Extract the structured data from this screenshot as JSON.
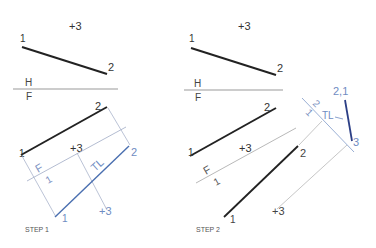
{
  "colors": {
    "ink": "#222222",
    "construction": "#b8b8b8",
    "blue": "#4a6fb0",
    "blue_dark": "#2c3f86",
    "blue_light": "#8ea6cf",
    "gray_text": "#555555"
  },
  "step1": {
    "caption": "STEP 1",
    "top_view": {
      "point3": "+3",
      "p1": "1",
      "p2": "2"
    },
    "fold_line": {
      "upper": "H",
      "lower": "F"
    },
    "front_view": {
      "p1": "1",
      "p2": "2",
      "point3": "+3"
    },
    "aux_fold": {
      "upper": "F",
      "lower": "1"
    },
    "aux_view": {
      "p1": "1",
      "p2": "2",
      "point3": "+3",
      "tl": "TL"
    }
  },
  "step2": {
    "caption": "STEP 2",
    "top_view": {
      "point3": "+3",
      "p1": "1",
      "p2": "2"
    },
    "fold_line": {
      "upper": "H",
      "lower": "F"
    },
    "front_view": {
      "p1": "1",
      "p2": "2",
      "point3": "+3"
    },
    "aux_fold": {
      "upper": "F",
      "lower": "1"
    },
    "aux_view": {
      "p1": "1",
      "p2": "2",
      "point3": "+3"
    },
    "second_fold": {
      "upper": "1",
      "lower": "2"
    },
    "point_view": {
      "p21": "2,1",
      "p3": "3",
      "tl": "TL"
    }
  }
}
